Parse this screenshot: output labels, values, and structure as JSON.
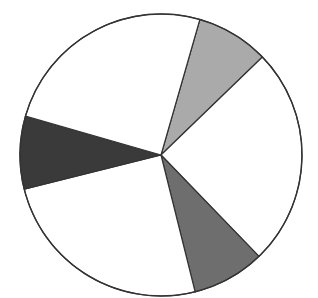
{
  "chart_data": {
    "type": "pie",
    "title": "",
    "start_angle_deg": 16,
    "direction": "clockwise",
    "center": [
      161,
      155
    ],
    "radius": 141,
    "slices": [
      {
        "label": "",
        "value": 8.33,
        "color": "#aaaaaa"
      },
      {
        "label": "",
        "value": 25.0,
        "color": "#ffffff"
      },
      {
        "label": "",
        "value": 8.33,
        "color": "#6e6e6e"
      },
      {
        "label": "",
        "value": 25.0,
        "color": "#ffffff"
      },
      {
        "label": "",
        "value": 8.33,
        "color": "#3a3a3a"
      },
      {
        "label": "",
        "value": 25.0,
        "color": "#ffffff"
      }
    ],
    "stroke_color": "#333333",
    "legend": "none",
    "labels_shown": false
  }
}
